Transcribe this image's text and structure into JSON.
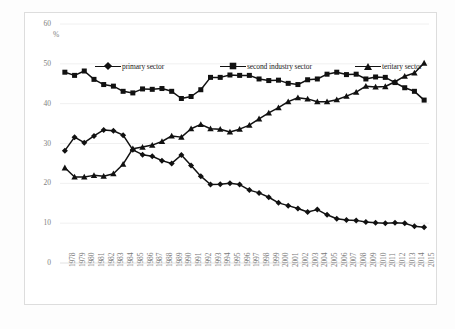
{
  "chart_data": {
    "type": "line",
    "title": "",
    "subtitle": "",
    "xlabel": "",
    "ylabel": "%",
    "unit_label": "%",
    "ylim": [
      0,
      60
    ],
    "yticks": [
      0,
      10,
      20,
      30,
      40,
      50,
      60
    ],
    "grid": "horizontal",
    "legend_position": "top-inside",
    "x": [
      1978,
      1979,
      1980,
      1981,
      1982,
      1983,
      1984,
      1985,
      1986,
      1987,
      1988,
      1989,
      1990,
      1991,
      1992,
      1993,
      1994,
      1995,
      1996,
      1997,
      1998,
      1999,
      2000,
      2001,
      2002,
      2003,
      2004,
      2005,
      2006,
      2007,
      2008,
      2009,
      2010,
      2011,
      2012,
      2013,
      2014,
      2015
    ],
    "categories": [
      "1978",
      "1979",
      "1980",
      "1981",
      "1982",
      "1983",
      "1984",
      "1985",
      "1986",
      "1987",
      "1988",
      "1989",
      "1990",
      "1991",
      "1992",
      "1993",
      "1994",
      "1995",
      "1996",
      "1997",
      "1998",
      "1999",
      "2000",
      "2001",
      "2002",
      "2003",
      "2004",
      "2005",
      "2006",
      "2007",
      "2008",
      "2009",
      "2010",
      "2011",
      "2012",
      "2013",
      "2014",
      "2015"
    ],
    "series": [
      {
        "name": "primary sector",
        "marker": "diamond",
        "color": "#111111",
        "values": [
          28.2,
          31.6,
          30.2,
          31.9,
          33.4,
          33.2,
          32.1,
          28.4,
          27.2,
          26.8,
          25.7,
          25.0,
          27.1,
          24.5,
          21.8,
          19.7,
          19.8,
          20.0,
          19.7,
          18.3,
          17.6,
          16.5,
          15.1,
          14.4,
          13.7,
          12.8,
          13.4,
          12.1,
          11.1,
          10.8,
          10.7,
          10.3,
          10.1,
          10.0,
          10.1,
          10.0,
          9.2,
          9.0
        ]
      },
      {
        "name": "second industry sector",
        "marker": "square",
        "color": "#111111",
        "values": [
          47.9,
          47.1,
          48.2,
          46.1,
          44.8,
          44.4,
          43.1,
          42.7,
          43.7,
          43.6,
          43.8,
          43.1,
          41.3,
          41.8,
          43.5,
          46.6,
          46.6,
          47.2,
          47.1,
          47.1,
          46.2,
          45.8,
          45.9,
          45.1,
          44.8,
          46.0,
          46.2,
          47.4,
          47.9,
          47.3,
          47.4,
          46.2,
          46.7,
          46.6,
          45.3,
          44.0,
          43.1,
          40.9
        ]
      },
      {
        "name": "teritary sector",
        "marker": "triangle",
        "color": "#111111",
        "values": [
          23.9,
          21.6,
          21.6,
          22.0,
          21.8,
          22.4,
          24.8,
          28.7,
          29.1,
          29.6,
          30.5,
          31.9,
          31.6,
          33.7,
          34.8,
          33.7,
          33.6,
          32.9,
          33.6,
          34.6,
          36.2,
          37.7,
          39.0,
          40.5,
          41.5,
          41.2,
          40.5,
          40.5,
          41.0,
          41.9,
          42.9,
          44.4,
          44.2,
          44.3,
          45.5,
          46.9,
          47.7,
          50.2
        ]
      }
    ]
  },
  "legend": {
    "items": [
      {
        "label": "primary sector",
        "marker": "diamond"
      },
      {
        "label": "second industry sector",
        "marker": "square"
      },
      {
        "label": "teritary sector",
        "marker": "triangle"
      }
    ]
  }
}
